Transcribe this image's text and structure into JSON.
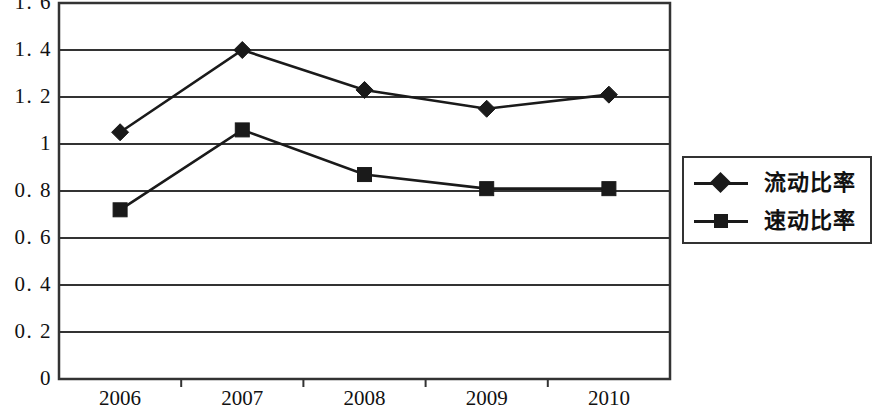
{
  "chart_data": {
    "type": "line",
    "title": "",
    "xlabel": "",
    "ylabel": "",
    "categories": [
      "2006",
      "2007",
      "2008",
      "2009",
      "2010"
    ],
    "series": [
      {
        "name": "流动比率",
        "marker": "diamond",
        "color": "#1a1a1a",
        "values": [
          1.05,
          1.4,
          1.23,
          1.15,
          1.21
        ]
      },
      {
        "name": "速动比率",
        "marker": "square",
        "color": "#1a1a1a",
        "values": [
          0.72,
          1.06,
          0.87,
          0.81,
          0.81
        ]
      }
    ],
    "ylim": [
      0,
      1.6
    ],
    "y_ticks": [
      0,
      0.2,
      0.4,
      0.6,
      0.8,
      1,
      1.2,
      1.4,
      1.6
    ],
    "y_tick_labels": [
      "0",
      "0. 2",
      "0. 4",
      "0. 6",
      "0. 8",
      "1",
      "1. 2",
      "1. 4",
      "1. 6"
    ],
    "grid": true,
    "grid_axis": "y",
    "legend_position": "right",
    "plot_border": true
  },
  "legend": {
    "items": [
      {
        "label": "流动比率",
        "marker": "diamond"
      },
      {
        "label": "速动比率",
        "marker": "square"
      }
    ]
  }
}
